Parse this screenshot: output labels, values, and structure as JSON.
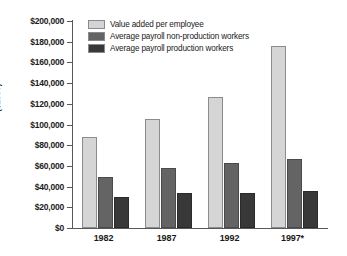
{
  "chart_data": {
    "type": "bar",
    "title": "",
    "subtitle": "",
    "xlabel": "",
    "ylabel": "($1997)",
    "categories": [
      "1982",
      "1987",
      "1992",
      "1997*"
    ],
    "series": [
      {
        "name": "Value added per employee",
        "color": "#d5d5d5",
        "values": [
          87500,
          105000,
          127000,
          176000
        ]
      },
      {
        "name": "Average payroll non-production workers",
        "color": "#646464",
        "values": [
          49000,
          58000,
          63000,
          67000
        ]
      },
      {
        "name": "Average payroll production workers",
        "color": "#383838",
        "values": [
          30000,
          34000,
          34000,
          36000
        ]
      }
    ],
    "ylim": [
      0,
      200000
    ],
    "ytick_values": [
      0,
      20000,
      40000,
      60000,
      80000,
      100000,
      120000,
      140000,
      160000,
      180000,
      200000
    ],
    "ytick_labels": [
      "$0",
      "$20,000",
      "$40,000",
      "$60,000",
      "$80,000",
      "$100,000",
      "$120,000",
      "$140,000",
      "$160,000",
      "$180,000",
      "$200,000"
    ],
    "grid": false,
    "legend_position": "top-left",
    "legend_entries": [
      "Value added per employee",
      "Average payroll non-production workers",
      "Average payroll production workers"
    ],
    "annotations": []
  }
}
